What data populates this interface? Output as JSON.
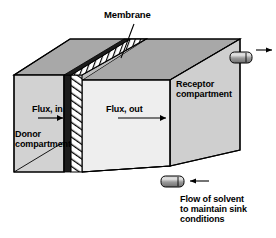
{
  "figure": {
    "type": "3d-schematic"
  },
  "labels": {
    "membrane": "Membrane",
    "flux_in": "Flux, in",
    "flux_out": "Flux, out",
    "donor_compartment": "Donor\ncompartment",
    "receptor_compartment": "Receptor\ncompartment",
    "flow_note": "Flow of solvent\nto maintain sink\nconditions"
  },
  "parts": {
    "membrane_icon": "hatched-membrane-slab",
    "inlet_port_icon": "port-tube",
    "outlet_port_icon": "port-tube",
    "flux_in_arrow_icon": "arrow-right-icon",
    "flux_out_arrow_icon": "arrow-right-icon",
    "outlet_arrow_icon": "arrow-right-icon",
    "inlet_arrow_icon": "arrow-left-icon",
    "membrane_leader_icon": "leader-line"
  },
  "colors": {
    "background": "#ffffff",
    "outline": "#000000",
    "donor_front_face": "#d2d2d2",
    "donor_top_face": "#a8a8a8",
    "inner_front_face": "#eeeeee",
    "inner_top_face": "#bdbdbd",
    "receptor_front_face": "#cfcfcf",
    "receptor_top_face": "#a8a8a8",
    "membrane_dark": "#1c1c1c",
    "membrane_hatch_fill": "#ffffff",
    "port_body": "#8c8c8c",
    "port_highlight": "#d8d8d8"
  },
  "geometry": {
    "canvas": {
      "width": 276,
      "height": 238
    },
    "donor_front_face": "14,75 64,75 64,172 14,172",
    "donor_top_face": "14,75 70,39 124,39 64,75",
    "inner_front_face": "82,80 170,80 170,166 82,166",
    "receptor_front_face": "170,55 240,39 240,150 170,166",
    "membrane_front_face": "64,75 82,75 82,172 64,172",
    "membrane_top_face": "64,75 124,39 146,39 82,75"
  }
}
